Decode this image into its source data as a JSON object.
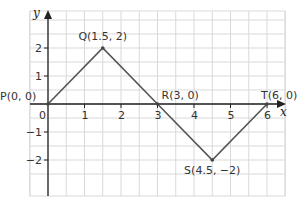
{
  "chart_data": {
    "type": "line",
    "title": "",
    "xlabel": "x",
    "ylabel": "y",
    "xlim": [
      -0.5,
      6.5
    ],
    "ylim": [
      -2.5,
      2.5
    ],
    "grid": true,
    "grid_step": 0.5,
    "x_ticks": [
      0,
      1,
      2,
      3,
      4,
      5,
      6
    ],
    "y_ticks": [
      -2,
      -1,
      1,
      2
    ],
    "x_tick_labels": [
      "0",
      "1",
      "2",
      "3",
      "4",
      "5",
      "6"
    ],
    "y_tick_labels": [
      "−2",
      "−1",
      "1",
      "2"
    ],
    "series": [
      {
        "name": "PQRST",
        "x": [
          0,
          1.5,
          3,
          4.5,
          6
        ],
        "y": [
          0,
          2,
          0,
          -2,
          0
        ]
      }
    ],
    "points": [
      {
        "name": "P",
        "x": 0,
        "y": 0,
        "label": "P(0, 0)"
      },
      {
        "name": "Q",
        "x": 1.5,
        "y": 2,
        "label": "Q(1.5, 2)"
      },
      {
        "name": "R",
        "x": 3,
        "y": 0,
        "label": "R(3, 0)"
      },
      {
        "name": "S",
        "x": 4.5,
        "y": -2,
        "label": "S(4.5, −2)"
      },
      {
        "name": "T",
        "x": 6,
        "y": 0,
        "label": "T(6, 0)"
      }
    ],
    "colors": {
      "line": "#555555",
      "axis": "#222222",
      "grid": "#d9d9d9"
    }
  },
  "labels": {
    "origin": "0",
    "x_axis": "x",
    "y_axis": "y"
  }
}
